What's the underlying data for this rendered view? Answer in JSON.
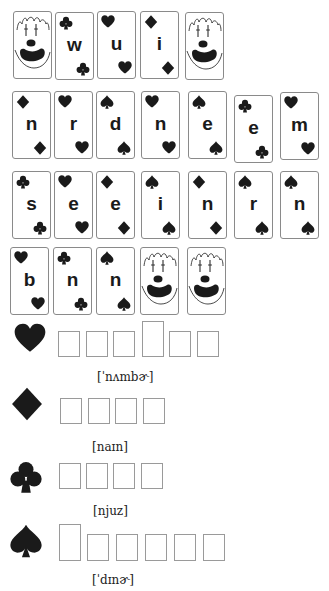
{
  "colors": {
    "ink": "#1a1a1a",
    "card_border": "#8a8a8a",
    "box_border": "#9a9a9a"
  },
  "card_rows": [
    [
      {
        "type": "joker"
      },
      {
        "type": "letter",
        "letter": "w",
        "suit": "club-icon"
      },
      {
        "type": "letter",
        "letter": "u",
        "suit": "heart-icon"
      },
      {
        "type": "letter",
        "letter": "i",
        "suit": "diamond-icon"
      },
      {
        "type": "joker"
      }
    ],
    [
      {
        "type": "letter",
        "letter": "n",
        "suit": "diamond-icon"
      },
      {
        "type": "letter",
        "letter": "r",
        "suit": "heart-icon"
      },
      {
        "type": "letter",
        "letter": "d",
        "suit": "spade-icon"
      },
      {
        "type": "letter",
        "letter": "n",
        "suit": "heart-icon"
      },
      {
        "type": "letter",
        "letter": "e",
        "suit": "spade-icon"
      },
      {
        "type": "letter",
        "letter": "e",
        "suit": "club-icon"
      },
      {
        "type": "letter",
        "letter": "m",
        "suit": "heart-icon"
      }
    ],
    [
      {
        "type": "letter",
        "letter": "s",
        "suit": "club-icon"
      },
      {
        "type": "letter",
        "letter": "e",
        "suit": "heart-icon"
      },
      {
        "type": "letter",
        "letter": "e",
        "suit": "diamond-icon"
      },
      {
        "type": "letter",
        "letter": "i",
        "suit": "spade-icon"
      },
      {
        "type": "letter",
        "letter": "n",
        "suit": "diamond-icon"
      },
      {
        "type": "letter",
        "letter": "r",
        "suit": "spade-icon"
      },
      {
        "type": "letter",
        "letter": "n",
        "suit": "spade-icon"
      }
    ],
    [
      {
        "type": "letter",
        "letter": "b",
        "suit": "heart-icon"
      },
      {
        "type": "letter",
        "letter": "n",
        "suit": "club-icon"
      },
      {
        "type": "letter",
        "letter": "n",
        "suit": "spade-icon"
      },
      {
        "type": "joker"
      },
      {
        "type": "joker"
      }
    ]
  ],
  "puzzles": [
    {
      "suit": "heart-icon",
      "boxes": 6,
      "tall_index": 3,
      "ipa": "[ˈnʌmbɚ]",
      "answer_values": [
        "",
        "",
        "",
        "",
        "",
        ""
      ]
    },
    {
      "suit": "diamond-icon",
      "boxes": 4,
      "tall_index": -1,
      "ipa": "[naɪn]",
      "answer_values": [
        "",
        "",
        "",
        ""
      ]
    },
    {
      "suit": "club-icon",
      "boxes": 4,
      "tall_index": -1,
      "ipa": "[njuz]",
      "answer_values": [
        "",
        "",
        "",
        ""
      ]
    },
    {
      "suit": "spade-icon",
      "boxes": 6,
      "tall_index": 0,
      "ipa": "[ˈdɪnɚ]",
      "answer_values": [
        "",
        "",
        "",
        "",
        "",
        ""
      ]
    }
  ]
}
